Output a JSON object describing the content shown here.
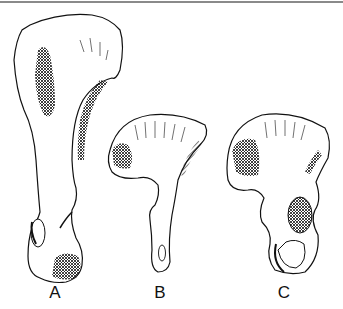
{
  "figure": {
    "panels": [
      {
        "label": "A",
        "subject": "tall elongated hip bone"
      },
      {
        "label": "B",
        "subject": "small hip bone with broad fan-shaped ilium"
      },
      {
        "label": "C",
        "subject": "hip bone with broad ilium and large acetabulum"
      }
    ]
  },
  "colors": {
    "ink": "#111111",
    "background": "#ffffff",
    "rule": "#8a8a8a"
  }
}
